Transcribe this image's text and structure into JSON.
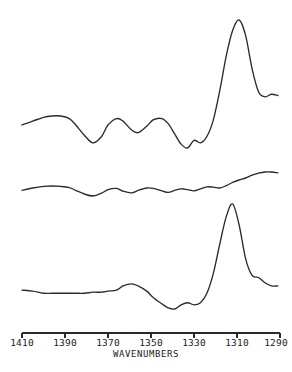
{
  "figure": {
    "name": "infrared-spectra-stack",
    "background_color": "#ffffff",
    "trace_color": "#2b2b2b",
    "axis_color": "#2b2b2b"
  },
  "chart_data": {
    "type": "line",
    "title": "",
    "subtitle": "",
    "xlabel": "WAVENUMBERS",
    "ylabel": "",
    "xlim": [
      1410,
      1290
    ],
    "x_axis_inverted": true,
    "grid": false,
    "legend": "none",
    "tick_labels": [
      "1410",
      "1390",
      "1370",
      "1350",
      "1330",
      "1310",
      "1290"
    ],
    "tick_values": [
      1410,
      1390,
      1370,
      1350,
      1330,
      1310,
      1290
    ],
    "annotations": [],
    "series": [
      {
        "name": "spectrum-top",
        "offset_note": "upper trace",
        "x": [
          1410,
          1405,
          1400,
          1396,
          1392,
          1388,
          1385,
          1381,
          1377,
          1373,
          1370,
          1366,
          1363,
          1359,
          1356,
          1352,
          1349,
          1345,
          1342,
          1339,
          1336,
          1333,
          1330,
          1327,
          1324,
          1321,
          1318,
          1315,
          1312,
          1309,
          1306,
          1303,
          1300,
          1297,
          1294,
          1291
        ],
        "values": [
          18,
          21,
          24,
          25,
          25,
          23,
          18,
          10,
          4,
          9,
          18,
          23,
          21,
          14,
          12,
          17,
          22,
          23,
          19,
          11,
          3,
          0,
          6,
          4,
          9,
          22,
          45,
          72,
          92,
          100,
          88,
          62,
          44,
          40,
          42,
          41
        ]
      },
      {
        "name": "spectrum-middle",
        "offset_note": "middle trace",
        "x": [
          1410,
          1405,
          1400,
          1396,
          1392,
          1388,
          1385,
          1381,
          1377,
          1373,
          1370,
          1366,
          1363,
          1359,
          1356,
          1352,
          1349,
          1345,
          1342,
          1339,
          1336,
          1333,
          1330,
          1327,
          1324,
          1321,
          1318,
          1315,
          1312,
          1309,
          1306,
          1303,
          1300,
          1297,
          1294,
          1291
        ],
        "values": [
          14,
          20,
          24,
          25,
          24,
          21,
          14,
          5,
          0,
          7,
          16,
          19,
          12,
          8,
          14,
          20,
          19,
          13,
          9,
          14,
          18,
          16,
          13,
          18,
          23,
          22,
          20,
          26,
          34,
          40,
          45,
          52,
          57,
          60,
          60,
          58
        ]
      },
      {
        "name": "spectrum-bottom",
        "offset_note": "lower trace",
        "x": [
          1410,
          1405,
          1400,
          1396,
          1392,
          1388,
          1385,
          1381,
          1377,
          1373,
          1370,
          1366,
          1363,
          1359,
          1356,
          1352,
          1349,
          1345,
          1342,
          1339,
          1336,
          1333,
          1330,
          1327,
          1324,
          1321,
          1318,
          1315,
          1312,
          1309,
          1306,
          1303,
          1300,
          1297,
          1294,
          1291
        ],
        "values": [
          18,
          17,
          15,
          15,
          15,
          15,
          15,
          15,
          16,
          16,
          17,
          18,
          22,
          24,
          22,
          17,
          11,
          5,
          1,
          0,
          4,
          6,
          4,
          6,
          15,
          34,
          62,
          88,
          100,
          80,
          48,
          32,
          30,
          25,
          22,
          22
        ]
      }
    ]
  },
  "axis": {
    "name": "wavenumbers-axis",
    "title": "WAVENUMBERS"
  }
}
